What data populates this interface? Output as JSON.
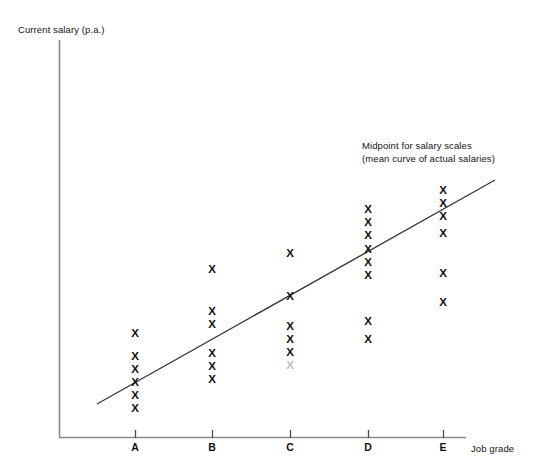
{
  "chart_data": {
    "type": "scatter",
    "title": "",
    "xlabel": "Job grade",
    "ylabel": "Current salary (p.a.)",
    "categories": [
      "A",
      "B",
      "C",
      "D",
      "E"
    ],
    "grid": false,
    "legend_position": "none",
    "marker_glyph": "X",
    "xlim": [
      0,
      6
    ],
    "ylim": [
      0,
      10
    ],
    "annotations": [
      {
        "line1": "Midpoint for salary scales",
        "line2": "(mean curve of actual salaries)"
      }
    ],
    "trend_line": {
      "label": "Midpoint for salary scales (mean curve of actual salaries)",
      "x_start": 97,
      "y_start": 404,
      "x_end": 495,
      "y_end": 180,
      "color": "#3a3a3a"
    },
    "series": [
      {
        "name": "Current salary (p.a.)",
        "points": [
          {
            "category": "A",
            "x": 135,
            "y": 333,
            "faded": false
          },
          {
            "category": "A",
            "x": 135,
            "y": 356,
            "faded": false
          },
          {
            "category": "A",
            "x": 135,
            "y": 369,
            "faded": false
          },
          {
            "category": "A",
            "x": 135,
            "y": 382,
            "faded": false
          },
          {
            "category": "A",
            "x": 135,
            "y": 395,
            "faded": false
          },
          {
            "category": "A",
            "x": 135,
            "y": 408,
            "faded": false
          },
          {
            "category": "B",
            "x": 212,
            "y": 269,
            "faded": false
          },
          {
            "category": "B",
            "x": 212,
            "y": 311,
            "faded": false
          },
          {
            "category": "B",
            "x": 212,
            "y": 324,
            "faded": false
          },
          {
            "category": "B",
            "x": 212,
            "y": 353,
            "faded": false
          },
          {
            "category": "B",
            "x": 212,
            "y": 366,
            "faded": false
          },
          {
            "category": "B",
            "x": 212,
            "y": 379,
            "faded": false
          },
          {
            "category": "C",
            "x": 290,
            "y": 253,
            "faded": false
          },
          {
            "category": "C",
            "x": 290,
            "y": 296,
            "faded": false
          },
          {
            "category": "C",
            "x": 290,
            "y": 326,
            "faded": false
          },
          {
            "category": "C",
            "x": 290,
            "y": 339,
            "faded": false
          },
          {
            "category": "C",
            "x": 290,
            "y": 352,
            "faded": false
          },
          {
            "category": "C",
            "x": 290,
            "y": 365,
            "faded": true
          },
          {
            "category": "D",
            "x": 368,
            "y": 209,
            "faded": false
          },
          {
            "category": "D",
            "x": 368,
            "y": 222,
            "faded": false
          },
          {
            "category": "D",
            "x": 368,
            "y": 235,
            "faded": false
          },
          {
            "category": "D",
            "x": 368,
            "y": 249,
            "faded": false
          },
          {
            "category": "D",
            "x": 368,
            "y": 262,
            "faded": false
          },
          {
            "category": "D",
            "x": 368,
            "y": 275,
            "faded": false
          },
          {
            "category": "D",
            "x": 368,
            "y": 321,
            "faded": false
          },
          {
            "category": "D",
            "x": 368,
            "y": 339,
            "faded": false
          },
          {
            "category": "E",
            "x": 443,
            "y": 190,
            "faded": false
          },
          {
            "category": "E",
            "x": 443,
            "y": 203,
            "faded": false
          },
          {
            "category": "E",
            "x": 443,
            "y": 216,
            "faded": false
          },
          {
            "category": "E",
            "x": 443,
            "y": 233,
            "faded": false
          },
          {
            "category": "E",
            "x": 443,
            "y": 273,
            "faded": false
          },
          {
            "category": "E",
            "x": 443,
            "y": 302,
            "faded": false
          }
        ]
      }
    ],
    "axes": {
      "y_axis": {
        "x": 59,
        "y_top": 40,
        "y_bottom": 437,
        "color": "#8a8a8a"
      },
      "x_axis": {
        "y": 437,
        "x_left": 59,
        "x_right": 466,
        "color": "#8a8a8a"
      },
      "tick_positions": [
        135,
        212,
        290,
        368,
        443
      ],
      "tick_length": 8
    }
  },
  "labels": {
    "y_axis_title": "Current salary (p.a.)",
    "x_axis_title": "Job grade",
    "tick_a": "A",
    "tick_b": "B",
    "tick_c": "C",
    "tick_d": "D",
    "tick_e": "E",
    "annotation_line1": "Midpoint for salary scales",
    "annotation_line2": "(mean curve of actual salaries)",
    "caption": ""
  }
}
